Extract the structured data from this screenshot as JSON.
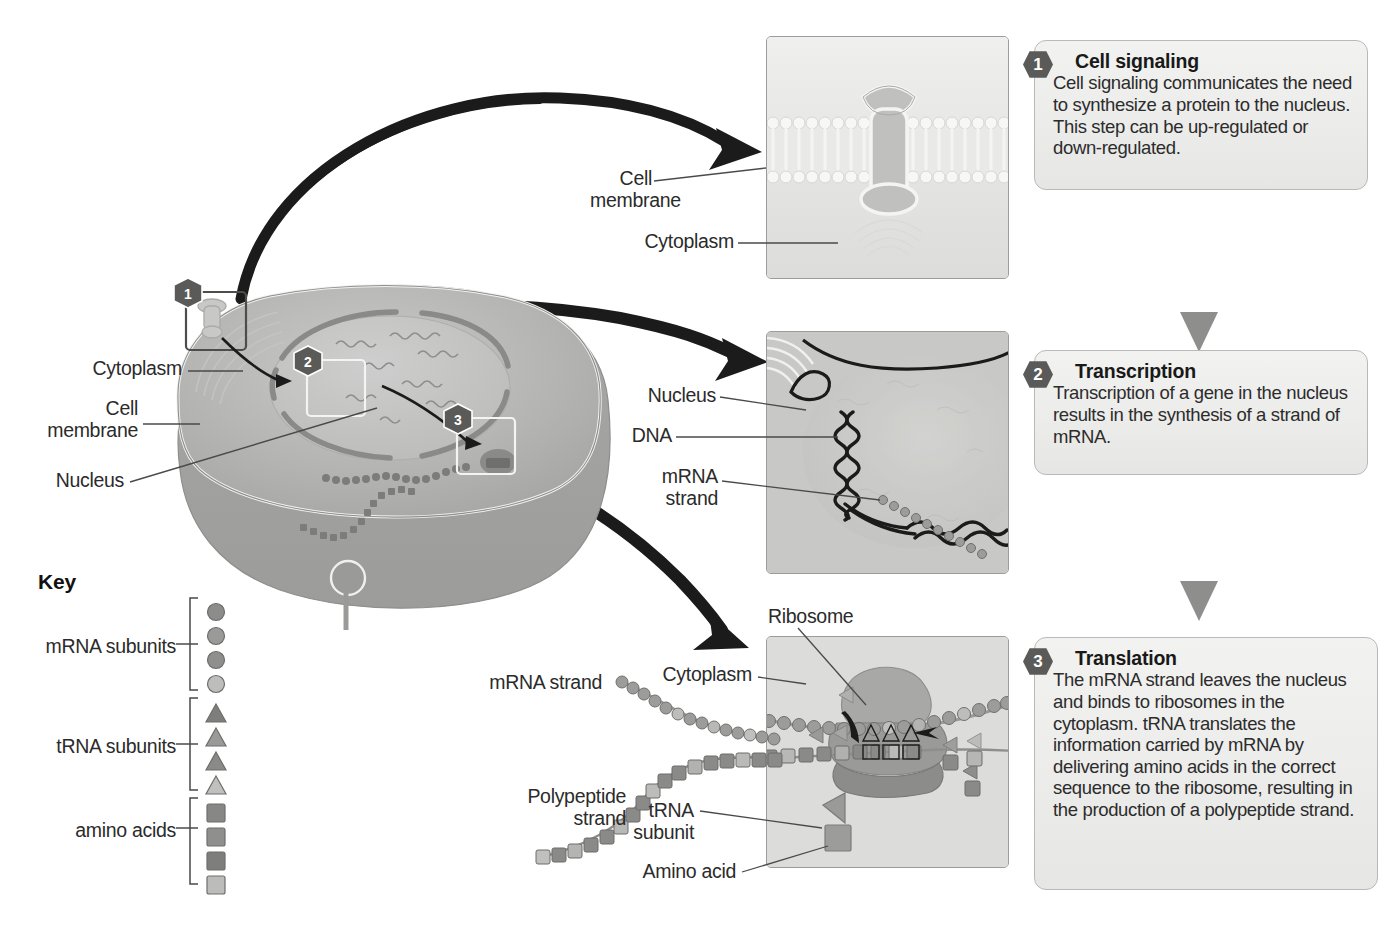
{
  "steps": [
    {
      "number": "1",
      "title": "Cell signaling",
      "body": "Cell signaling communicates the need to synthesize a protein to the nucleus. This step can be up-regulated or down-regulated."
    },
    {
      "number": "2",
      "title": "Transcription",
      "body": "Transcription of a gene in the nucleus results in the synthesis of a strand of mRNA."
    },
    {
      "number": "3",
      "title": "Translation",
      "body": "The mRNA strand leaves the nucleus and binds to ribosomes in the cytoplasm. tRNA translates the information carried by mRNA by delivering amino acids in the correct sequence to the ribosome, resulting in the production of a polypeptide strand."
    }
  ],
  "cell_labels": {
    "cytoplasm": "Cytoplasm",
    "cell_membrane": "Cell\nmembrane",
    "nucleus": "Nucleus"
  },
  "panel1_labels": {
    "cell_membrane": "Cell\nmembrane",
    "cytoplasm": "Cytoplasm"
  },
  "panel2_labels": {
    "nucleus": "Nucleus",
    "dna": "DNA",
    "mrna_strand": "mRNA\nstrand"
  },
  "panel3_labels": {
    "ribosome": "Ribosome",
    "cytoplasm": "Cytoplasm",
    "mrna_strand": "mRNA strand",
    "polypeptide_strand": "Polypeptide\nstrand",
    "trna_subunit": "tRNA\nsubunit",
    "amino_acid": "Amino acid"
  },
  "key": {
    "title": "Key",
    "entries": [
      {
        "label": "mRNA subunits",
        "shape": "circle",
        "shades": [
          "#8c8c8a",
          "#9a9a98",
          "#8f8f8d",
          "#bdbdbb"
        ]
      },
      {
        "label": "tRNA subunits",
        "shape": "triangle",
        "shades": [
          "#7e7e7c",
          "#9a9a98",
          "#8a8a88",
          "#c0c0be"
        ]
      },
      {
        "label": "amino acids",
        "shape": "square",
        "shades": [
          "#878785",
          "#8f8f8d",
          "#7e7e7c",
          "#bcbcba"
        ]
      }
    ]
  },
  "colors": {
    "arrow_dark": "#1b1b1b",
    "arrow_gray": "#9a9a98",
    "panel_bg": "#e4e4e2",
    "callout_bg": "#ececea",
    "badge_bg": "#5a5a58",
    "cytoplasm": "#b4b4b2",
    "cell_outer": "#9e9e9c",
    "nucleus": "#c2c2c0",
    "text": "#2b2b2b"
  }
}
